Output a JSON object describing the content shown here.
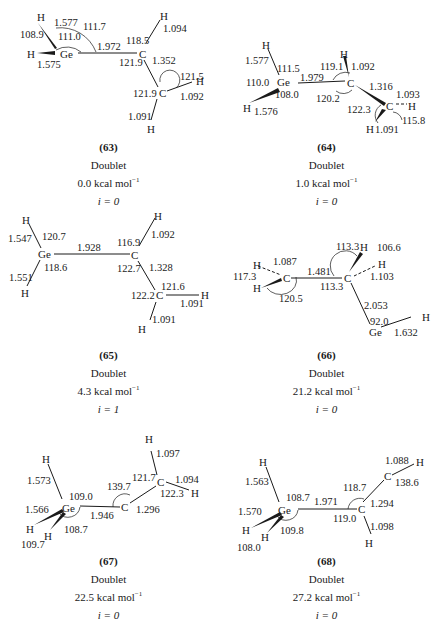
{
  "figure": {
    "structures": [
      {
        "id": "(63)",
        "state": "Doublet",
        "energy": "0.0",
        "energy_unit": "kcal mol",
        "energy_exp": "−1",
        "imag": "i = 0",
        "atoms": [
          "H",
          "H",
          "Ge",
          "C",
          "H",
          "C",
          "H",
          "H"
        ],
        "bond_lengths": [
          "1.577",
          "1.575",
          "1.972",
          "1.094",
          "1.352",
          "1.092",
          "1.091"
        ],
        "angles": [
          "108.9",
          "111.0",
          "111.7",
          "118.5",
          "121.9",
          "121.5",
          "121.9"
        ]
      },
      {
        "id": "(64)",
        "state": "Doublet",
        "energy": "1.0",
        "energy_unit": "kcal mol",
        "energy_exp": "−1",
        "imag": "i = 0",
        "atoms": [
          "H",
          "Ge",
          "H",
          "H",
          "C",
          "C",
          "H",
          "H"
        ],
        "bond_lengths": [
          "1.577",
          "1.576",
          "1.979",
          "1.092",
          "1.316",
          "1.093",
          "1.091"
        ],
        "angles": [
          "111.5",
          "110.0",
          "108.0",
          "119.1",
          "120.2",
          "122.3",
          "115.8"
        ]
      },
      {
        "id": "(65)",
        "state": "Doublet",
        "energy": "4.3",
        "energy_unit": "kcal mol",
        "energy_exp": "−1",
        "imag": "i = 1",
        "atoms": [
          "H",
          "Ge",
          "H",
          "C",
          "H",
          "C",
          "H",
          "H"
        ],
        "bond_lengths": [
          "1.547",
          "1.551",
          "1.928",
          "1.092",
          "1.328",
          "1.091",
          "1.091"
        ],
        "angles": [
          "120.7",
          "118.6",
          "116.9",
          "122.7",
          "121.6",
          "122.2"
        ]
      },
      {
        "id": "(66)",
        "state": "Doublet",
        "energy": "21.2",
        "energy_unit": "kcal mol",
        "energy_exp": "−1",
        "imag": "i = 0",
        "atoms": [
          "H",
          "H",
          "C",
          "C",
          "H",
          "H",
          "Ge",
          "H"
        ],
        "bond_lengths": [
          "1.087",
          "1.481",
          "1.103",
          "2.053",
          "1.632"
        ],
        "angles": [
          "117.3",
          "120.5",
          "113.3",
          "113.3",
          "106.6",
          "92.0"
        ]
      },
      {
        "id": "(67)",
        "state": "Doublet",
        "energy": "22.5",
        "energy_unit": "kcal mol",
        "energy_exp": "−1",
        "imag": "i = 0",
        "atoms": [
          "H",
          "Ge",
          "H",
          "H",
          "C",
          "C",
          "H",
          "H"
        ],
        "bond_lengths": [
          "1.573",
          "1.566",
          "1.946",
          "1.296",
          "1.097",
          "1.094"
        ],
        "angles": [
          "109.0",
          "108.7",
          "109.7",
          "139.7",
          "121.7",
          "122.3"
        ]
      },
      {
        "id": "(68)",
        "state": "Doublet",
        "energy": "27.2",
        "energy_unit": "kcal mol",
        "energy_exp": "−1",
        "imag": "i = 0",
        "atoms": [
          "H",
          "Ge",
          "H",
          "H",
          "C",
          "H",
          "C",
          "H"
        ],
        "bond_lengths": [
          "1.563",
          "1.570",
          "1.971",
          "1.294",
          "1.098",
          "1.088"
        ],
        "angles": [
          "108.7",
          "109.8",
          "108.0",
          "118.7",
          "119.0",
          "138.6"
        ]
      }
    ]
  }
}
